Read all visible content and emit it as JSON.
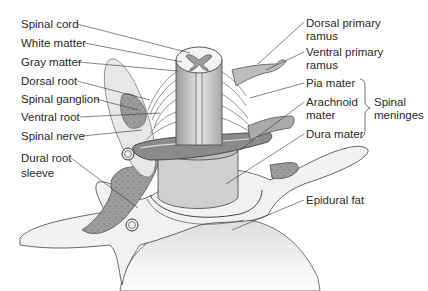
{
  "figure": {
    "background": "#ffffff",
    "line_color": "#3a3a3a",
    "tissue_dark": "#8e8e8e",
    "tissue_mid": "#bdbdbd",
    "tissue_light": "#e4e4e4"
  },
  "labels_left": [
    {
      "id": "spinal-cord",
      "text": "Spinal cord"
    },
    {
      "id": "white-matter",
      "text": "White matter"
    },
    {
      "id": "gray-matter",
      "text": "Gray matter"
    },
    {
      "id": "dorsal-root",
      "text": "Dorsal root"
    },
    {
      "id": "spinal-ganglion",
      "text": "Spinal ganglion"
    },
    {
      "id": "ventral-root",
      "text": "Ventral root"
    },
    {
      "id": "spinal-nerve",
      "text": "Spinal nerve"
    },
    {
      "id": "dural-root-sleeve",
      "text": "Dural root\nsleeve"
    }
  ],
  "labels_right": [
    {
      "id": "dorsal-primary-ramus",
      "text": "Dorsal primary\nramus"
    },
    {
      "id": "ventral-primary-ramus",
      "text": "Ventral primary\nramus"
    },
    {
      "id": "pia-mater",
      "text": "Pia mater"
    },
    {
      "id": "arachnoid-mater",
      "text": "Arachnoid\nmater"
    },
    {
      "id": "dura-mater",
      "text": "Dura mater"
    },
    {
      "id": "epidural-fat",
      "text": "Epidural fat"
    }
  ],
  "group_label": {
    "id": "spinal-meninges",
    "text": "Spinal\nmeninges"
  }
}
